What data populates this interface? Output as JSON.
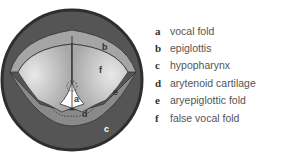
{
  "figure": {
    "labels_on_diagram": [
      "a",
      "b",
      "c",
      "d",
      "e",
      "f"
    ]
  },
  "legend": {
    "items": [
      {
        "key": "a",
        "label": "vocal fold"
      },
      {
        "key": "b",
        "label": "epiglottis"
      },
      {
        "key": "c",
        "label": "hypopharynx"
      },
      {
        "key": "d",
        "label": "arytenoid cartilage"
      },
      {
        "key": "e",
        "label": "aryepiglottic fold"
      },
      {
        "key": "f",
        "label": "false vocal fold"
      }
    ]
  },
  "colors": {
    "outer_ring": "#3a3a3a",
    "dark": "#555555",
    "mid": "#9a9a9a",
    "light": "#c8c8c8",
    "glottis": "#ffffff"
  }
}
